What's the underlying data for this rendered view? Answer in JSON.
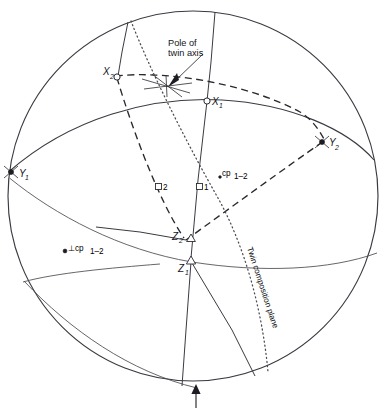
{
  "figure": {
    "type": "stereographic-projection",
    "background_color": "#ffffff",
    "line_color": "#3a3a42",
    "text_color": "#14141a"
  },
  "annotations": {
    "pole_of_twin_axis": {
      "line1": "Pole of",
      "line2": "twin axis",
      "marker": "star-cross"
    },
    "twin_composition_plane": "Twin composition plane",
    "cp_label": "cp",
    "cp_subscript": "1–2",
    "perp_cp_symbol": "⊥cp",
    "perp_cp_subscript": "1–2",
    "box_label_1": "1",
    "box_label_2": "2"
  },
  "axes_points": [
    {
      "id": "X1",
      "letter": "X",
      "sub": "1",
      "marker": "open-circle"
    },
    {
      "id": "X2",
      "letter": "X",
      "sub": "2",
      "marker": "open-circle"
    },
    {
      "id": "Y1",
      "letter": "Y",
      "sub": "1",
      "marker": "filled-dot"
    },
    {
      "id": "Y2",
      "letter": "Y",
      "sub": "2",
      "marker": "filled-dot"
    },
    {
      "id": "Z1",
      "letter": "Z",
      "sub": "1",
      "marker": "triangle"
    },
    {
      "id": "Z2",
      "letter": "Z",
      "sub": "2",
      "marker": "triangle"
    }
  ],
  "labels": {
    "x1": "X",
    "x1_sub": "1",
    "x2": "X",
    "x2_sub": "2",
    "y1": "Y",
    "y1_sub": "1",
    "y2": "Y",
    "y2_sub": "2",
    "z1": "Z",
    "z1_sub": "1",
    "z2": "Z",
    "z2_sub": "2"
  },
  "bottom_arrow": {
    "name": "view-direction-arrow",
    "direction": "up"
  }
}
